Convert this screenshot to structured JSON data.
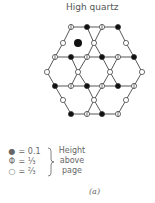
{
  "title": "High quartz",
  "caption": "(a)",
  "legend": {
    "items": [
      {
        "symbol": "●",
        "label": "= 0.1",
        "meaning": "filled-circle"
      },
      {
        "symbol": "Φ",
        "label": "= ⅓",
        "meaning": "half-circle"
      },
      {
        "symbol": "○",
        "label": "= ⅔",
        "meaning": "open-circle"
      }
    ],
    "note_lines": [
      "Height",
      "above",
      "page"
    ]
  },
  "lattice": {
    "center_atom": {
      "x": 78,
      "y": 43
    },
    "nodes": [
      {
        "x": 71,
        "y": 27,
        "t": "half"
      },
      {
        "x": 87,
        "y": 27,
        "t": "black"
      },
      {
        "x": 102,
        "y": 27,
        "t": "half"
      },
      {
        "x": 118,
        "y": 27,
        "t": "black"
      },
      {
        "x": 63,
        "y": 43,
        "t": "open"
      },
      {
        "x": 94,
        "y": 43,
        "t": "open"
      },
      {
        "x": 126,
        "y": 43,
        "t": "open"
      },
      {
        "x": 55,
        "y": 57,
        "t": "half"
      },
      {
        "x": 71,
        "y": 57,
        "t": "black"
      },
      {
        "x": 87,
        "y": 57,
        "t": "half"
      },
      {
        "x": 102,
        "y": 57,
        "t": "black"
      },
      {
        "x": 118,
        "y": 57,
        "t": "half"
      },
      {
        "x": 134,
        "y": 57,
        "t": "black"
      },
      {
        "x": 47,
        "y": 72,
        "t": "open"
      },
      {
        "x": 78,
        "y": 72,
        "t": "open"
      },
      {
        "x": 110,
        "y": 72,
        "t": "open"
      },
      {
        "x": 142,
        "y": 72,
        "t": "open"
      },
      {
        "x": 55,
        "y": 86,
        "t": "black"
      },
      {
        "x": 71,
        "y": 86,
        "t": "half"
      },
      {
        "x": 87,
        "y": 86,
        "t": "black"
      },
      {
        "x": 102,
        "y": 86,
        "t": "half"
      },
      {
        "x": 118,
        "y": 86,
        "t": "black"
      },
      {
        "x": 134,
        "y": 86,
        "t": "half"
      },
      {
        "x": 63,
        "y": 100,
        "t": "open"
      },
      {
        "x": 94,
        "y": 100,
        "t": "open"
      },
      {
        "x": 126,
        "y": 100,
        "t": "open"
      },
      {
        "x": 71,
        "y": 114,
        "t": "black"
      },
      {
        "x": 87,
        "y": 114,
        "t": "half"
      },
      {
        "x": 102,
        "y": 114,
        "t": "black"
      },
      {
        "x": 118,
        "y": 114,
        "t": "half"
      }
    ]
  }
}
